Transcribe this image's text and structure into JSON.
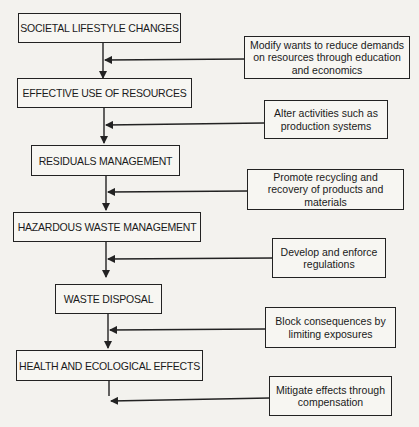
{
  "stages": [
    {
      "label": "SOCIETAL LIFESTYLE CHANGES"
    },
    {
      "label": "EFFECTIVE USE OF RESOURCES"
    },
    {
      "label": "RESIDUALS MANAGEMENT"
    },
    {
      "label": "HAZARDOUS WASTE MANAGEMENT"
    },
    {
      "label": "WASTE DISPOSAL"
    },
    {
      "label": "HEALTH AND ECOLOGICAL EFFECTS"
    }
  ],
  "actions": [
    {
      "label": "Modify wants to reduce demands on resources through education and economics"
    },
    {
      "label": "Alter activities such as production systems"
    },
    {
      "label": "Promote recycling and recovery of products and materials"
    },
    {
      "label": "Develop and enforce regulations"
    },
    {
      "label": "Block consequences by limiting exposures"
    },
    {
      "label": "Mitigate effects through compensation"
    }
  ],
  "colors": {
    "line": "#222222",
    "background": "#f3f2ee"
  }
}
